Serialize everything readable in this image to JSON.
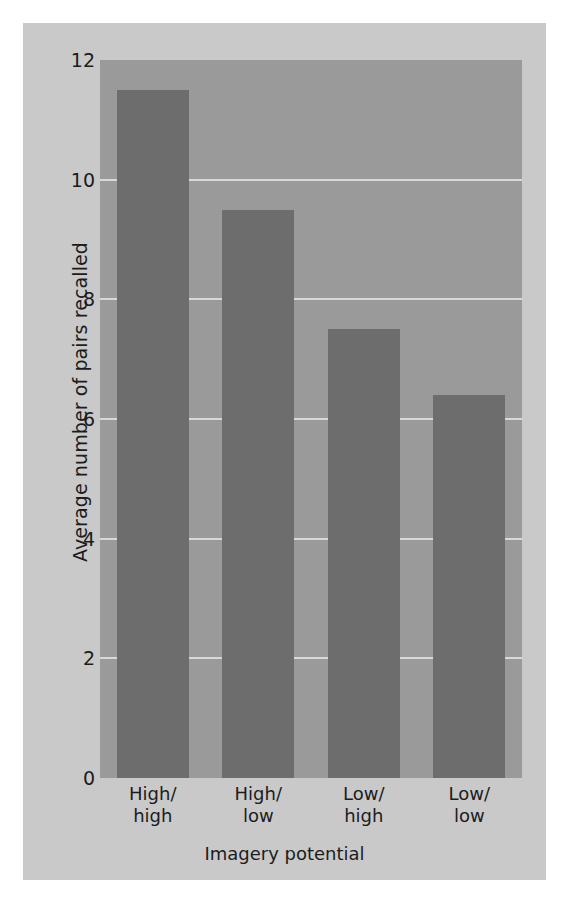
{
  "chart_data": {
    "type": "bar",
    "title": "",
    "categories": [
      "High/\nhigh",
      "High/\nlow",
      "Low/\nhigh",
      "Low/\nlow"
    ],
    "values": [
      11.5,
      9.5,
      7.5,
      6.4
    ],
    "xlabel": "Imagery potential",
    "ylabel": "Average number of pairs recalled",
    "ylim": [
      0,
      12
    ],
    "yticks": [
      0,
      2,
      4,
      6,
      8,
      10,
      12
    ],
    "ytick_labels": [
      "0",
      "2",
      "4",
      "6",
      "8",
      "10",
      "12"
    ],
    "grid": true,
    "grid_axis": "y",
    "legend": false,
    "bar_color": "#6d6d6d",
    "plot_background": "#9a9a9a",
    "figure_background": "#c9c9c9",
    "gridline_color": "#d8d8d8"
  }
}
